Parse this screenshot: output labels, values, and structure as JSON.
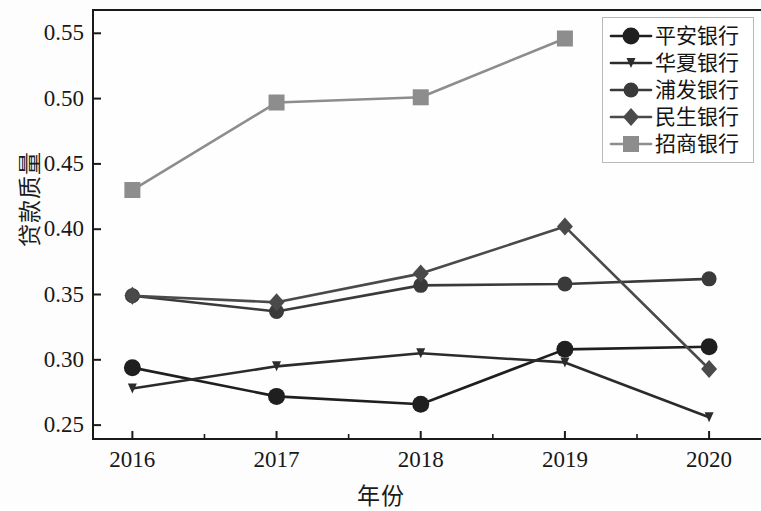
{
  "chart_data": {
    "type": "line",
    "title": "",
    "xlabel": "年份",
    "ylabel": "贷款质量",
    "categories": [
      "2016",
      "2017",
      "2018",
      "2019",
      "2020"
    ],
    "x": [
      2016,
      2017,
      2018,
      2019,
      2020
    ],
    "xlim": [
      2015.72,
      2020.36
    ],
    "ylim": [
      0.2386,
      0.5686
    ],
    "yticks": [
      0.25,
      0.3,
      0.35,
      0.4,
      0.45,
      0.5,
      0.55
    ],
    "ytick_labels": [
      "0.25",
      "0.30",
      "0.35",
      "0.40",
      "0.45",
      "0.50",
      "0.55"
    ],
    "xticks": [
      2016,
      2017,
      2018,
      2019,
      2020
    ],
    "xtick_labels": [
      "2016",
      "2017",
      "2018",
      "2019",
      "2020"
    ],
    "minor_xticks": true,
    "grid": false,
    "legend_position": "upper right",
    "series": [
      {
        "name": "平安银行",
        "marker": "circle-large",
        "color": "#1f1f1f",
        "values": [
          0.294,
          0.272,
          0.266,
          0.308,
          0.31
        ]
      },
      {
        "name": "华夏银行",
        "marker": "triangle-down-small",
        "color": "#2b2b2b",
        "values": [
          0.278,
          0.295,
          0.305,
          0.298,
          0.256
        ]
      },
      {
        "name": "浦发银行",
        "marker": "circle-medium",
        "color": "#3a3a3a",
        "values": [
          0.349,
          0.337,
          0.357,
          0.358,
          0.362
        ]
      },
      {
        "name": "民生银行",
        "marker": "diamond",
        "color": "#4a4a4a",
        "values": [
          0.349,
          0.344,
          0.366,
          0.402,
          0.293
        ]
      },
      {
        "name": "招商银行",
        "marker": "square",
        "color": "#8d8d8d",
        "values": [
          0.43,
          0.497,
          0.501,
          0.546,
          null
        ]
      }
    ]
  },
  "axes": {
    "ylabel": "贷款质量",
    "xlabel": "年份"
  }
}
